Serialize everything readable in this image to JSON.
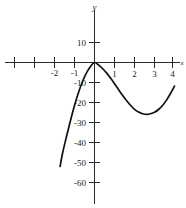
{
  "chart_data": {
    "type": "line",
    "title": "",
    "xlabel": "x",
    "ylabel": "y",
    "xlim": [
      -4.2,
      4.3
    ],
    "ylim": [
      -62,
      18
    ],
    "grid": false,
    "legend": null,
    "x_ticks": [
      -4,
      -3,
      -2,
      -1,
      1,
      2,
      3,
      4
    ],
    "x_tick_labels": [
      "",
      "",
      "-2",
      "-1",
      "1",
      "2",
      "3",
      "4"
    ],
    "y_ticks": [
      10,
      -10,
      -20,
      -30,
      -40,
      -50,
      -60
    ],
    "y_tick_labels": [
      "10",
      "-10",
      "-20",
      "-30",
      "-40",
      "-50",
      "-60"
    ],
    "series": [
      {
        "name": "curve",
        "color": "#111111",
        "x": [
          -1.72,
          -1.6,
          -1.4,
          -1.2,
          -1.0,
          -0.8,
          -0.6,
          -0.4,
          -0.2,
          0.0,
          0.2,
          0.4,
          0.6,
          0.8,
          1.0,
          1.2,
          1.4,
          1.6,
          1.8,
          2.0,
          2.2,
          2.4,
          2.6,
          2.8,
          3.0,
          3.2,
          3.4,
          3.6,
          3.8,
          4.0
        ],
        "y": [
          -52.0,
          -45.0,
          -36.3,
          -28.5,
          -21.6,
          -15.6,
          -10.6,
          -6.5,
          -3.4,
          0.0,
          -1.0,
          -2.6,
          -4.8,
          -7.5,
          -10.6,
          -14.0,
          -17.6,
          -21.2,
          -24.7,
          -28.0,
          -31.0,
          -33.5,
          -35.3,
          -36.4,
          -36.6,
          -35.8,
          -34.0,
          -35.0,
          -28.0,
          -20.0
        ],
        "y_display": [
          -52.0,
          -45.5,
          -37.0,
          -29.0,
          -21.5,
          -15.0,
          -9.5,
          -5.2,
          -2.0,
          0.0,
          -1.2,
          -3.0,
          -5.2,
          -7.8,
          -10.6,
          -13.5,
          -16.4,
          -19.0,
          -21.4,
          -23.4,
          -24.8,
          -25.6,
          -25.9,
          -25.6,
          -24.9,
          -23.5,
          -21.5,
          -18.8,
          -15.5,
          -11.8
        ]
      }
    ],
    "annotations": {
      "local_max": {
        "x": 0,
        "y": 0
      },
      "local_min": {
        "x": 3.0,
        "y": -25.0
      },
      "left_endpoint": {
        "x": -1.72,
        "y": -52.0
      },
      "right_endpoint": {
        "x": 4.0,
        "y": -11.8
      }
    }
  }
}
